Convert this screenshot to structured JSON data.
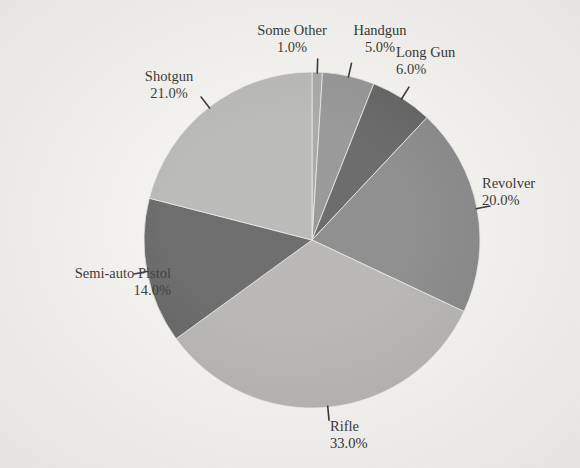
{
  "chart_data": {
    "type": "pie",
    "title": "",
    "subtitle": "",
    "xlabel": "",
    "ylabel": "",
    "legend_position": "none",
    "grid": false,
    "labels_show_percent": true,
    "start_angle_deg": 0,
    "direction": "clockwise",
    "categories": [
      "Some Other",
      "Handgun",
      "Long Gun",
      "Revolver",
      "Rifle",
      "Semi-auto Pistol",
      "Shotgun"
    ],
    "values": [
      1.0,
      5.0,
      6.0,
      20.0,
      33.0,
      14.0,
      21.0
    ],
    "value_labels": [
      "1.0%",
      "5.0%",
      "6.0%",
      "20.0%",
      "33.0%",
      "14.0%",
      "21.0%"
    ],
    "slices": [
      {
        "name": "Some Other",
        "value": 1.0,
        "value_label": "1.0%",
        "color": "#9a9a9a"
      },
      {
        "name": "Handgun",
        "value": 5.0,
        "value_label": "5.0%",
        "color": "#858585"
      },
      {
        "name": "Long Gun",
        "value": 6.0,
        "value_label": "6.0%",
        "color": "#4d4d4d"
      },
      {
        "name": "Revolver",
        "value": 20.0,
        "value_label": "20.0%",
        "color": "#787878"
      },
      {
        "name": "Rifle",
        "value": 33.0,
        "value_label": "33.0%",
        "color": "#abaaa8"
      },
      {
        "name": "Semi-auto Pistol",
        "value": 14.0,
        "value_label": "14.0%",
        "color": "#4f4f4f"
      },
      {
        "name": "Shotgun",
        "value": 21.0,
        "value_label": "21.0%",
        "color": "#adadab"
      }
    ]
  },
  "callouts": [
    {
      "name": "Some Other",
      "value_label": "1.0%",
      "align": "center",
      "x": 244,
      "y": 22,
      "w": 96
    },
    {
      "name": "Handgun",
      "value_label": "5.0%",
      "align": "center",
      "x": 342,
      "y": 22,
      "w": 76
    },
    {
      "name": "Long Gun",
      "value_label": "6.0%",
      "align": "left",
      "x": 396,
      "y": 44,
      "w": 90
    },
    {
      "name": "Revolver",
      "value_label": "20.0%",
      "align": "left",
      "x": 482,
      "y": 175,
      "w": 92
    },
    {
      "name": "Rifle",
      "value_label": "33.0%",
      "align": "left",
      "x": 330,
      "y": 418,
      "w": 80
    },
    {
      "name": "Semi-auto Pistol",
      "value_label": "14.0%",
      "align": "right",
      "x": 26,
      "y": 265,
      "w": 145
    },
    {
      "name": "Shotgun",
      "value_label": "21.0%",
      "align": "center",
      "x": 126,
      "y": 68,
      "w": 86
    }
  ],
  "geometry": {
    "cx": 312,
    "cy": 240,
    "r": 168
  },
  "colors": {
    "background": "#f3f2ef",
    "text": "#1a1a1a",
    "leader_line": "#1c1c1c",
    "slice_edge": "#e9e8e4"
  }
}
